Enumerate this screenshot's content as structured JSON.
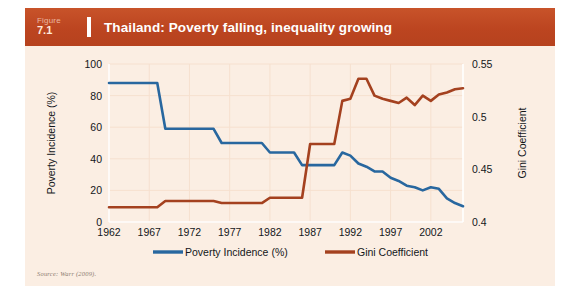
{
  "figure": {
    "label_word": "Figure",
    "label_number": "7.1",
    "title": "Thailand: Poverty falling, inequality growing",
    "source": "Source: Warr (2009)."
  },
  "colors": {
    "header_bar": "#bc4520",
    "card_background": "#fbeee3",
    "poverty_line": "#28679f",
    "gini_line": "#a4411f",
    "text": "#13161a",
    "gridline": "#f6e0cf"
  },
  "chart_data": {
    "type": "line",
    "title": "Thailand: Poverty falling, inequality growing",
    "xlabel": "",
    "ylabel": "Poverty Incidence (%)",
    "y2label": "Gini Coefficient",
    "xlim": [
      1962,
      2006
    ],
    "ylim": [
      0,
      100
    ],
    "y2lim": [
      0.4,
      0.55
    ],
    "yticks": [
      0,
      20,
      40,
      60,
      80,
      100
    ],
    "y2ticks": [
      0.4,
      0.45,
      0.5,
      0.55
    ],
    "xticks": [
      1962,
      1967,
      1972,
      1977,
      1982,
      1987,
      1992,
      1997,
      2002
    ],
    "grid": true,
    "legend_position": "bottom",
    "series": [
      {
        "name": "Poverty Incidence (%)",
        "axis": "left",
        "color": "#28679f",
        "x": [
          1962,
          1963,
          1964,
          1965,
          1966,
          1967,
          1968,
          1969,
          1970,
          1971,
          1972,
          1973,
          1974,
          1975,
          1976,
          1977,
          1978,
          1979,
          1980,
          1981,
          1982,
          1983,
          1984,
          1985,
          1986,
          1987,
          1988,
          1989,
          1990,
          1991,
          1992,
          1993,
          1994,
          1995,
          1996,
          1997,
          1998,
          1999,
          2000,
          2001,
          2002,
          2003,
          2004,
          2005,
          2006
        ],
        "values": [
          88,
          88,
          88,
          88,
          88,
          88,
          88,
          59,
          59,
          59,
          59,
          59,
          59,
          59,
          50,
          50,
          50,
          50,
          50,
          50,
          44,
          44,
          44,
          44,
          36,
          36,
          36,
          36,
          36,
          44,
          42,
          37,
          35,
          32,
          32,
          28,
          26,
          23,
          22,
          20,
          22,
          21,
          15,
          12,
          10
        ]
      },
      {
        "name": "Gini Coefficient",
        "axis": "right",
        "color": "#a4411f",
        "x": [
          1962,
          1963,
          1964,
          1965,
          1966,
          1967,
          1968,
          1969,
          1970,
          1971,
          1972,
          1973,
          1974,
          1975,
          1976,
          1977,
          1978,
          1979,
          1980,
          1981,
          1982,
          1983,
          1984,
          1985,
          1986,
          1987,
          1988,
          1989,
          1990,
          1991,
          1992,
          1993,
          1994,
          1995,
          1996,
          1997,
          1998,
          1999,
          2000,
          2001,
          2002,
          2003,
          2004,
          2005,
          2006
        ],
        "values": [
          0.414,
          0.414,
          0.414,
          0.414,
          0.414,
          0.414,
          0.414,
          0.42,
          0.42,
          0.42,
          0.42,
          0.42,
          0.42,
          0.42,
          0.418,
          0.418,
          0.418,
          0.418,
          0.418,
          0.418,
          0.423,
          0.423,
          0.423,
          0.423,
          0.423,
          0.474,
          0.474,
          0.474,
          0.474,
          0.515,
          0.517,
          0.536,
          0.536,
          0.52,
          0.517,
          0.515,
          0.513,
          0.518,
          0.511,
          0.52,
          0.515,
          0.521,
          0.523,
          0.526,
          0.527
        ]
      }
    ],
    "legend": [
      {
        "label": "Poverty Incidence (%)",
        "color": "#28679f"
      },
      {
        "label": "Gini Coefficient",
        "color": "#a4411f"
      }
    ]
  }
}
